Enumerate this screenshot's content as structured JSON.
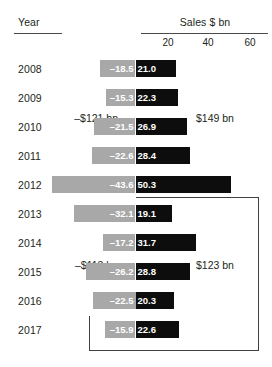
{
  "header": {
    "year_label": "Year",
    "sales_label": "Sales $ bn"
  },
  "axis": {
    "ticks": [
      "20",
      "40",
      "60"
    ]
  },
  "annotations": {
    "group1_negative_total": "–$121 bn",
    "group1_positive_total": "$149 bn",
    "group2_negative_total": "–$113 bn",
    "group2_positive_total": "$123 bn"
  },
  "colors": {
    "negative_bar": "#a8a8a8",
    "positive_bar": "#0d0d0d",
    "text": "#231f20",
    "rule": "#4a4a4a",
    "bracket": "#3f3f3f",
    "bar_label": "#ffffff"
  },
  "rows": [
    {
      "year": "2008",
      "negative_label": "–18.5",
      "positive_label": "21.0"
    },
    {
      "year": "2009",
      "negative_label": "–15.3",
      "positive_label": "22.3"
    },
    {
      "year": "2010",
      "negative_label": "–21.5",
      "positive_label": "26.9"
    },
    {
      "year": "2011",
      "negative_label": "–22.6",
      "positive_label": "28.4"
    },
    {
      "year": "2012",
      "negative_label": "–43.6",
      "positive_label": "50.3"
    },
    {
      "year": "2013",
      "negative_label": "–32.1",
      "positive_label": "19.1"
    },
    {
      "year": "2014",
      "negative_label": "–17.2",
      "positive_label": "31.7"
    },
    {
      "year": "2015",
      "negative_label": "–26.2",
      "positive_label": "28.8"
    },
    {
      "year": "2016",
      "negative_label": "–22.5",
      "positive_label": "20.3"
    },
    {
      "year": "2017",
      "negative_label": "–15.9",
      "positive_label": "22.6"
    }
  ],
  "chart_data": {
    "type": "bar",
    "subtype": "diverging-horizontal",
    "title": "Sales $ bn",
    "xlabel": "Sales $ bn",
    "ylabel": "Year",
    "categories": [
      "2008",
      "2009",
      "2010",
      "2011",
      "2012",
      "2013",
      "2014",
      "2015",
      "2016",
      "2017"
    ],
    "series": [
      {
        "name": "negative",
        "color": "#a8a8a8",
        "values": [
          -18.5,
          -15.3,
          -21.5,
          -22.6,
          -43.6,
          -32.1,
          -17.2,
          -26.2,
          -22.5,
          -15.9
        ]
      },
      {
        "name": "positive",
        "color": "#0d0d0d",
        "values": [
          21.0,
          22.3,
          26.9,
          28.4,
          50.3,
          19.1,
          31.7,
          28.8,
          20.3,
          22.6
        ]
      }
    ],
    "xticks": [
      20,
      40,
      60
    ],
    "xlim": [
      -50,
      62
    ],
    "grid": false,
    "legend": false,
    "annotations": [
      {
        "text": "–$121 bn",
        "group": "2008-2012",
        "side": "negative",
        "value": -121
      },
      {
        "text": "$149 bn",
        "group": "2008-2012",
        "side": "positive",
        "value": 149
      },
      {
        "text": "–$113 bn",
        "group": "2013-2017",
        "side": "negative",
        "value": -113
      },
      {
        "text": "$123 bn",
        "group": "2013-2017",
        "side": "positive",
        "value": 123
      }
    ]
  }
}
